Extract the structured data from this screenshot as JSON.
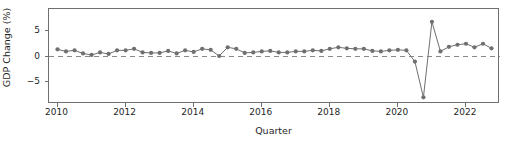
{
  "chart_data": {
    "type": "line",
    "title": "",
    "xlabel": "Quarter",
    "ylabel": "GDP Change (%)",
    "xlim": [
      2009.75,
      2023.0
    ],
    "ylim": [
      -9.3,
      9.3
    ],
    "yticks": [
      5,
      0,
      -5
    ],
    "ytick_labels": [
      "5",
      "0",
      "−5"
    ],
    "xticks": [
      2010,
      2012,
      2014,
      2016,
      2018,
      2020,
      2022
    ],
    "xtick_labels": [
      "2010",
      "2012",
      "2014",
      "2016",
      "2018",
      "2020",
      "2022"
    ],
    "grid": false,
    "legend": null,
    "marker": "circle",
    "line_color": "#6f6f6f",
    "marker_color": "#6f6f6f",
    "zero_line": {
      "value": 0,
      "style": "dashed",
      "color": "#8a8a8a"
    },
    "x": [
      2010.0,
      2010.25,
      2010.5,
      2010.75,
      2011.0,
      2011.25,
      2011.5,
      2011.75,
      2012.0,
      2012.25,
      2012.5,
      2012.75,
      2013.0,
      2013.25,
      2013.5,
      2013.75,
      2014.0,
      2014.25,
      2014.5,
      2014.75,
      2015.0,
      2015.25,
      2015.5,
      2015.75,
      2016.0,
      2016.25,
      2016.5,
      2016.75,
      2017.0,
      2017.25,
      2017.5,
      2017.75,
      2018.0,
      2018.25,
      2018.5,
      2018.75,
      2019.0,
      2019.25,
      2019.5,
      2019.75,
      2020.0,
      2020.25,
      2020.5,
      2020.75,
      2021.0,
      2021.25,
      2021.5,
      2021.75,
      2022.0,
      2022.25,
      2022.5,
      2022.75
    ],
    "y": [
      1.4,
      1.0,
      1.2,
      0.6,
      0.3,
      0.8,
      0.5,
      1.2,
      1.2,
      1.5,
      0.8,
      0.7,
      0.7,
      1.1,
      0.6,
      1.2,
      0.9,
      1.5,
      1.3,
      0.1,
      1.8,
      1.5,
      0.7,
      0.8,
      1.0,
      1.1,
      0.8,
      0.8,
      1.0,
      1.0,
      1.2,
      1.1,
      1.5,
      1.8,
      1.6,
      1.5,
      1.5,
      1.1,
      1.0,
      1.2,
      1.3,
      1.2,
      -1.0,
      -8.0,
      6.8,
      1.0,
      1.9,
      2.3,
      2.5,
      1.8,
      2.5,
      1.6
    ],
    "series": [
      {
        "name": "GDP Change",
        "values": [
          1.4,
          1.0,
          1.2,
          0.6,
          0.3,
          0.8,
          0.5,
          1.2,
          1.2,
          1.5,
          0.8,
          0.7,
          0.7,
          1.1,
          0.6,
          1.2,
          0.9,
          1.5,
          1.3,
          0.1,
          1.8,
          1.5,
          0.7,
          0.8,
          1.0,
          1.1,
          0.8,
          0.8,
          1.0,
          1.0,
          1.2,
          1.1,
          1.5,
          1.8,
          1.6,
          1.5,
          1.5,
          1.1,
          1.0,
          1.2,
          1.3,
          1.2,
          -1.0,
          -8.0,
          6.8,
          1.0,
          1.9,
          2.3,
          2.5,
          1.8,
          2.5,
          1.6
        ]
      }
    ],
    "annotations": []
  }
}
